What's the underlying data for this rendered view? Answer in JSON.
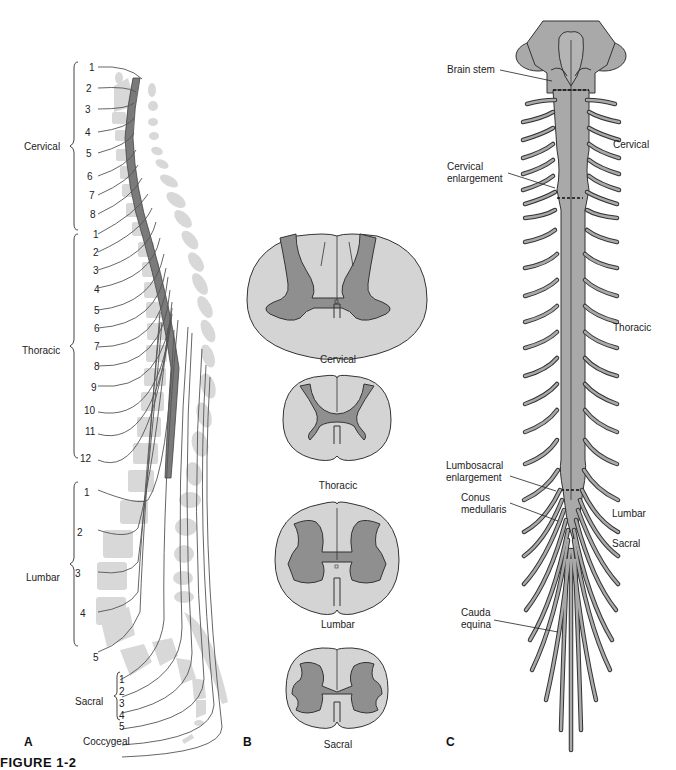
{
  "figure": {
    "caption": "FIGURE 1-2",
    "colors": {
      "background": "#ffffff",
      "bone": "#d8d8d8",
      "cord_dark": "#7a7a7a",
      "gray_matter": "#8f8f8f",
      "white_matter": "#d4d4d4",
      "cord_c": "#a9a9a9",
      "outline": "#333333"
    }
  },
  "panel_a": {
    "letter": "A",
    "regions": [
      {
        "name": "Cervical",
        "numbers": [
          "1",
          "2",
          "3",
          "4",
          "5",
          "6",
          "7",
          "8"
        ]
      },
      {
        "name": "Thoracic",
        "numbers": [
          "1",
          "2",
          "3",
          "4",
          "5",
          "6",
          "7",
          "8",
          "9",
          "10",
          "11",
          "12"
        ]
      },
      {
        "name": "Lumbar",
        "numbers": [
          "1",
          "2",
          "3",
          "4",
          "5"
        ]
      },
      {
        "name": "Sacral",
        "numbers": [
          "1",
          "2",
          "3",
          "4",
          "5"
        ]
      },
      {
        "name": "Coccygeal",
        "numbers": []
      }
    ]
  },
  "panel_b": {
    "letter": "B",
    "sections": [
      {
        "label": "Cervical"
      },
      {
        "label": "Thoracic"
      },
      {
        "label": "Lumbar"
      },
      {
        "label": "Sacral"
      }
    ]
  },
  "panel_c": {
    "letter": "C",
    "left_labels": [
      {
        "text": "Brain stem"
      },
      {
        "text": "Cervical\nenlargement",
        "line1": "Cervical",
        "line2": "enlargement"
      },
      {
        "text": "Lumbosacral\nenlargement",
        "line1": "Lumbosacral",
        "line2": "enlargement"
      },
      {
        "text": "Conus\nmedullaris",
        "line1": "Conus",
        "line2": "medullaris"
      },
      {
        "text": "Cauda\nequina",
        "line1": "Cauda",
        "line2": "equina"
      }
    ],
    "right_labels": [
      {
        "text": "Cervical"
      },
      {
        "text": "Thoracic"
      },
      {
        "text": "Lumbar"
      },
      {
        "text": "Sacral"
      }
    ]
  }
}
